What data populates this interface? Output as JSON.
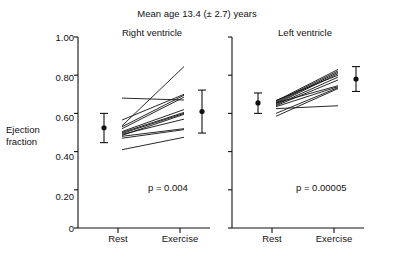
{
  "figure": {
    "title": "Mean age 13.4 (± 2.7) years",
    "y_axis_label_line1": "Ejection",
    "y_axis_label_line2": "fraction"
  },
  "panels": {
    "right": {
      "title": "Right ventricle",
      "p_value_text": "p = 0.004",
      "x_rest": "Rest",
      "x_exercise": "Exercise"
    },
    "left": {
      "title": "Left ventricle",
      "p_value_text": "p = 0.00005",
      "x_rest": "Rest",
      "x_exercise": "Exercise"
    }
  },
  "axis": {
    "yticks": [
      "1.00",
      "0.80",
      "0.60",
      "0.40",
      "0.20",
      "0"
    ]
  },
  "chart_data": {
    "type": "line",
    "title": "Mean age 13.4 (± 2.7) years",
    "xlabel": "",
    "ylabel": "Ejection fraction",
    "ylim": [
      0,
      1.0
    ],
    "ytick_values": [
      0,
      0.2,
      0.4,
      0.6,
      0.8,
      1.0
    ],
    "ytick_labels": [
      "0",
      "0.20",
      "0.40",
      "0.60",
      "0.80",
      "1.00"
    ],
    "categories": [
      "Rest",
      "Exercise"
    ],
    "grid": false,
    "legend": "none",
    "panels": [
      {
        "name": "Right ventricle",
        "annotation": "p = 0.004",
        "subject_lines": [
          {
            "rest": 0.535,
            "exercise": 0.845
          },
          {
            "rest": 0.565,
            "exercise": 0.7
          },
          {
            "rest": 0.53,
            "exercise": 0.695
          },
          {
            "rest": 0.52,
            "exercise": 0.685
          },
          {
            "rest": 0.68,
            "exercise": 0.67
          },
          {
            "rest": 0.505,
            "exercise": 0.62
          },
          {
            "rest": 0.5,
            "exercise": 0.605
          },
          {
            "rest": 0.495,
            "exercise": 0.6
          },
          {
            "rest": 0.485,
            "exercise": 0.595
          },
          {
            "rest": 0.49,
            "exercise": 0.57
          },
          {
            "rest": 0.48,
            "exercise": 0.52
          },
          {
            "rest": 0.47,
            "exercise": 0.515
          },
          {
            "rest": 0.41,
            "exercise": 0.475
          }
        ],
        "mean_markers": [
          {
            "x": "Rest",
            "mean": 0.525,
            "err_low": 0.447,
            "err_high": 0.6
          },
          {
            "x": "Exercise",
            "mean": 0.61,
            "err_low": 0.497,
            "err_high": 0.722
          }
        ]
      },
      {
        "name": "Left ventricle",
        "annotation": "p = 0.00005",
        "subject_lines": [
          {
            "rest": 0.665,
            "exercise": 0.83
          },
          {
            "rest": 0.66,
            "exercise": 0.822
          },
          {
            "rest": 0.655,
            "exercise": 0.815
          },
          {
            "rest": 0.65,
            "exercise": 0.808
          },
          {
            "rest": 0.668,
            "exercise": 0.8
          },
          {
            "rest": 0.645,
            "exercise": 0.79
          },
          {
            "rest": 0.64,
            "exercise": 0.775
          },
          {
            "rest": 0.655,
            "exercise": 0.745
          },
          {
            "rest": 0.635,
            "exercise": 0.74
          },
          {
            "rest": 0.6,
            "exercise": 0.735
          },
          {
            "rest": 0.585,
            "exercise": 0.73
          },
          {
            "rest": 0.625,
            "exercise": 0.64
          }
        ],
        "mean_markers": [
          {
            "x": "Rest",
            "mean": 0.655,
            "err_low": 0.6,
            "err_high": 0.707
          },
          {
            "x": "Exercise",
            "mean": 0.78,
            "err_low": 0.715,
            "err_high": 0.845
          }
        ]
      }
    ]
  }
}
